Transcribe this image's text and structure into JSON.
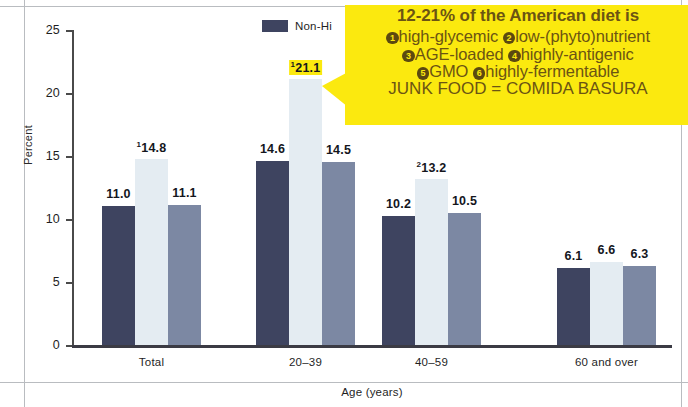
{
  "legend": {
    "series_label": "Non-Hi"
  },
  "callout": {
    "line1": "12-21% of the American diet is",
    "line2_a": "high-glycemic",
    "line2_b": "low-(phyto)nutrient",
    "line3_a": "AGE-loaded",
    "line3_b": "highly-antigenic",
    "line4_a": "GMO",
    "line4_b": "highly-fermentable",
    "line5": "JUNK FOOD = COMIDA BASURA",
    "marker1": "1",
    "marker2": "2",
    "marker3": "3",
    "marker4": "4",
    "marker5": "5",
    "marker6": "6",
    "bg_color": "#fbe90f",
    "text_color": "#6b5413"
  },
  "chart_data": {
    "type": "bar",
    "title": "",
    "xlabel": "Age (years)",
    "ylabel": "Percent",
    "ylim": [
      0,
      25
    ],
    "yticks": [
      0,
      5,
      10,
      15,
      20,
      25
    ],
    "grid": false,
    "legend_position": "top-center",
    "categories": [
      "Total",
      "20–39",
      "40–59",
      "60 and over"
    ],
    "series": [
      {
        "name": "Non-Hi",
        "color": "#3e4460",
        "values": [
          11.0,
          14.6,
          10.2,
          6.1
        ],
        "labels": [
          "11.0",
          "14.6",
          "10.2",
          "6.1"
        ]
      },
      {
        "name": "series-2",
        "color": "#e4ecf2",
        "values": [
          14.8,
          21.1,
          13.2,
          6.6
        ],
        "labels": [
          "14.8",
          "21.1",
          "13.2",
          "6.6"
        ],
        "label_superscripts": [
          "1",
          "1",
          "2",
          ""
        ],
        "label_highlight": [
          false,
          true,
          false,
          false
        ]
      },
      {
        "name": "series-3",
        "color": "#7c88a3",
        "values": [
          11.1,
          14.5,
          10.5,
          6.3
        ],
        "labels": [
          "11.1",
          "14.5",
          "10.5",
          "6.3"
        ]
      }
    ]
  }
}
